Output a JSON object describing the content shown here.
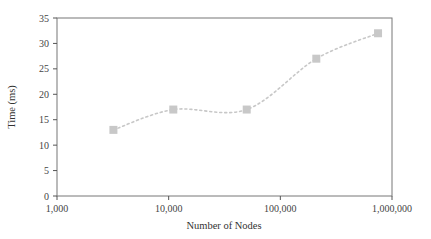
{
  "chart_data": {
    "type": "line",
    "title": "",
    "xlabel": "Number of Nodes",
    "ylabel": "Time (ms)",
    "x_scale": "log",
    "xlim": [
      1000,
      1000000
    ],
    "ylim": [
      0,
      35
    ],
    "x_ticks": [
      1000,
      10000,
      100000,
      1000000
    ],
    "x_tick_labels": [
      "1,000",
      "10,000",
      "100,000",
      "1,000,000"
    ],
    "y_ticks": [
      0,
      5,
      10,
      15,
      20,
      25,
      30,
      35
    ],
    "y_tick_labels": [
      "0",
      "5",
      "10",
      "15",
      "20",
      "25",
      "30",
      "35"
    ],
    "grid": false,
    "legend": null,
    "series": [
      {
        "name": "Time",
        "marker": "square",
        "line_style": "dotted-smooth",
        "color": "#c8c8c8",
        "x": [
          3200,
          11000,
          50000,
          210000,
          750000
        ],
        "values": [
          13,
          17,
          17,
          27,
          32
        ]
      }
    ]
  }
}
